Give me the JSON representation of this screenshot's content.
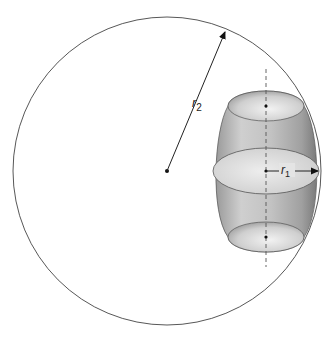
{
  "diagram": {
    "type": "geometry",
    "labels": {
      "r2": {
        "main": "r",
        "sub": "2"
      },
      "r1": {
        "main": "r",
        "sub": "1"
      }
    },
    "colors": {
      "stroke": "#333333",
      "barrel_light": "#e6e6e6",
      "barrel_mid": "#b5b5b5",
      "barrel_dark": "#7a7a7a",
      "background": "#ffffff"
    }
  }
}
